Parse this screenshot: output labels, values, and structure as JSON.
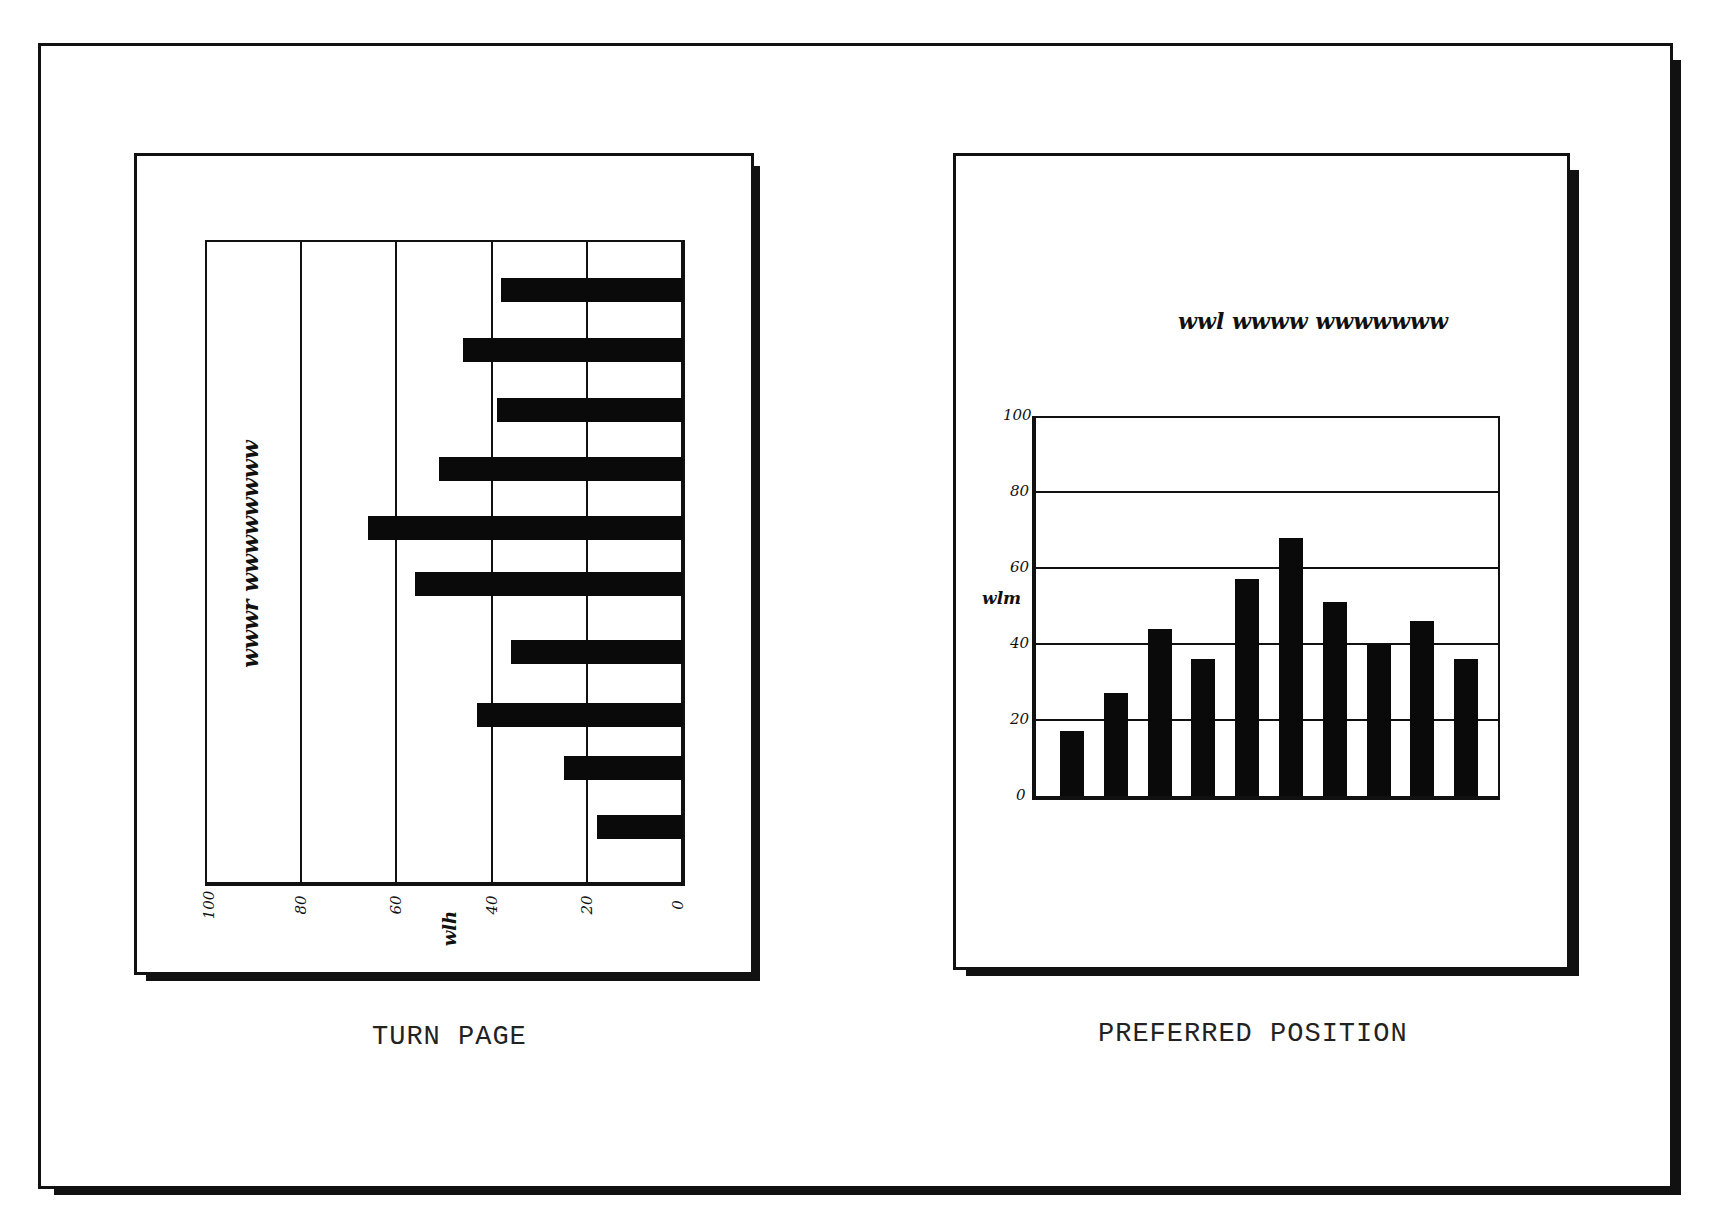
{
  "figure": {
    "panels": [
      {
        "id": "left",
        "caption": "TURN PAGE",
        "chart_title": "wwwr wwwwwwww",
        "axis_label": "wlh",
        "orientation": "rotated-horizontal"
      },
      {
        "id": "right",
        "caption": "PREFERRED POSITION",
        "chart_title": "wwl wwww wwwwwww",
        "axis_label": "wlm",
        "orientation": "vertical"
      }
    ]
  },
  "chart_data": [
    {
      "type": "bar",
      "title": "wwwr wwwwwwww",
      "caption": "TURN PAGE",
      "orientation": "horizontal (page rotated 90°)",
      "categories": [
        "1",
        "2",
        "3",
        "4",
        "5",
        "6",
        "7",
        "8",
        "9",
        "10"
      ],
      "values": [
        38,
        46,
        39,
        51,
        66,
        56,
        36,
        43,
        25,
        18
      ],
      "xlabel": "wlh",
      "ylabel": "",
      "ticks": [
        "100",
        "80",
        "60",
        "40",
        "20",
        "0"
      ],
      "xlim": [
        0,
        100
      ],
      "grid": true,
      "legend": null
    },
    {
      "type": "bar",
      "title": "wwl wwww wwwwwww",
      "caption": "PREFERRED POSITION",
      "orientation": "vertical",
      "categories": [
        "1",
        "2",
        "3",
        "4",
        "5",
        "6",
        "7",
        "8",
        "9",
        "10"
      ],
      "values": [
        17,
        27,
        44,
        36,
        57,
        68,
        51,
        40,
        46,
        36
      ],
      "xlabel": "",
      "ylabel": "wlm",
      "ticks": [
        "100",
        "80",
        "60",
        "40",
        "20",
        "0"
      ],
      "ylim": [
        0,
        100
      ],
      "grid": true,
      "legend": null
    }
  ]
}
